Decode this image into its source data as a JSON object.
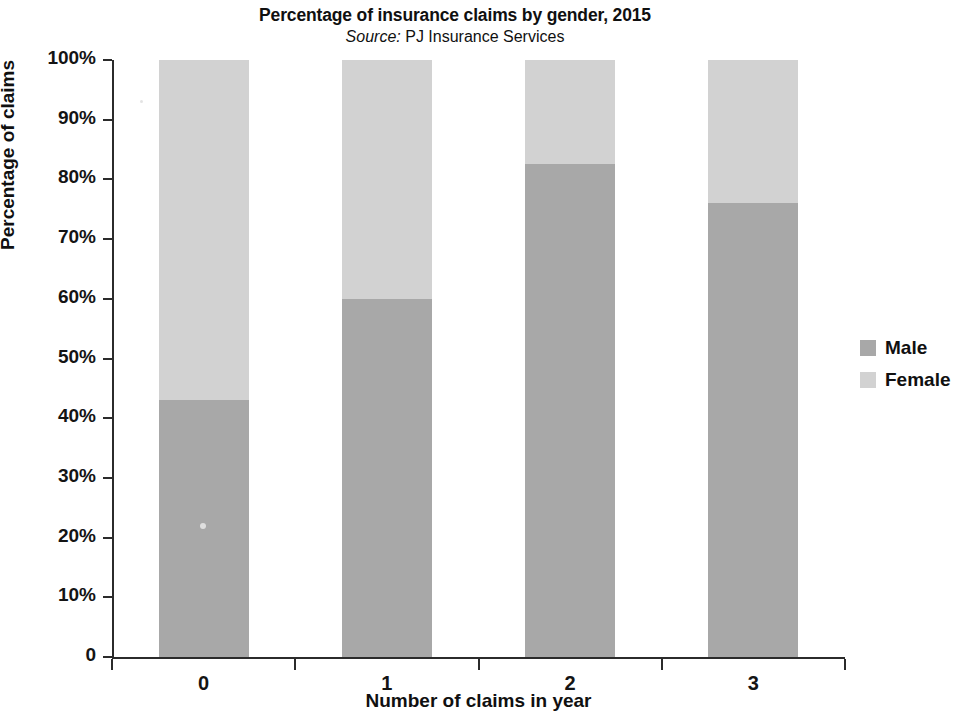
{
  "chart_data": {
    "type": "bar",
    "subtype": "stacked-100-percent",
    "title": "Percentage of insurance claims by gender, 2015",
    "subtitle_prefix": "Source:",
    "subtitle_text": "PJ Insurance Services",
    "xlabel": "Number of claims in year",
    "ylabel": "Percentage of claims",
    "categories": [
      "0",
      "1",
      "2",
      "3"
    ],
    "ylim": [
      0,
      100
    ],
    "ytick_labels": [
      "0",
      "10%",
      "20%",
      "30%",
      "40%",
      "50%",
      "60%",
      "70%",
      "80%",
      "90%",
      "100%"
    ],
    "ytick_values": [
      0,
      10,
      20,
      30,
      40,
      50,
      60,
      70,
      80,
      90,
      100
    ],
    "grid": false,
    "legend_position": "right",
    "series": [
      {
        "name": "Male",
        "color": "#a8a8a8",
        "values": [
          43,
          60,
          82.5,
          76
        ]
      },
      {
        "name": "Female",
        "color": "#d2d2d2",
        "values": [
          57,
          40,
          17.5,
          24
        ]
      }
    ]
  },
  "legend": {
    "items": [
      {
        "label": "Male",
        "color": "#a8a8a8"
      },
      {
        "label": "Female",
        "color": "#d2d2d2"
      }
    ]
  }
}
